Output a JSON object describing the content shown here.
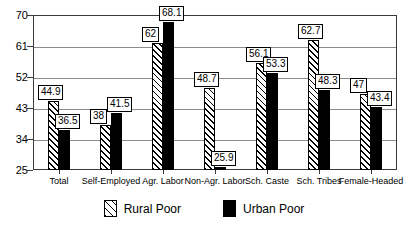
{
  "chart_data": {
    "type": "bar",
    "title": "",
    "subtitle": "",
    "xlabel": "",
    "ylabel": "",
    "ylim": [
      25,
      70
    ],
    "yticks": [
      25,
      34,
      43,
      52,
      61,
      70
    ],
    "grid": true,
    "legend_position": "bottom-center",
    "categories": [
      "Total",
      "Self-Employed",
      "Agr. Labor",
      "Non-Agr. Labor",
      "Sch. Caste",
      "Sch. Tribes",
      "Female-Headed"
    ],
    "series": [
      {
        "name": "Rural Poor",
        "pattern": "diagonal-hatch",
        "color": "#ffffff",
        "values": [
          44.9,
          38,
          62,
          48.7,
          56.1,
          62.7,
          47
        ],
        "labels": [
          "44.9",
          "38",
          "62",
          "48.7",
          "56.1",
          "62.7",
          "47"
        ]
      },
      {
        "name": "Urban Poor",
        "pattern": "solid",
        "color": "#000000",
        "values": [
          36.5,
          41.5,
          68.1,
          25.9,
          53.3,
          48.3,
          43.4
        ],
        "labels": [
          "36.5",
          "41.5",
          "68.1",
          "25.9",
          "53.3",
          "48.3",
          "43.4"
        ]
      }
    ]
  },
  "legend": {
    "entries": [
      {
        "label": "Rural Poor",
        "swatch": "hatched-swatch"
      },
      {
        "label": "Urban Poor",
        "swatch": "solid-black-swatch"
      }
    ]
  }
}
